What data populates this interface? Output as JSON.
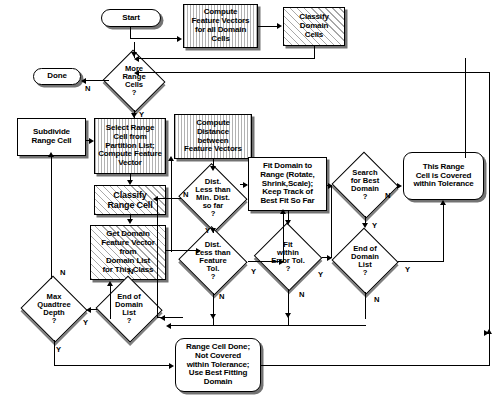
{
  "diagram": {
    "type": "flowchart",
    "nodes": [
      {
        "id": "start",
        "label": "Start",
        "shape": "terminator",
        "fill": "plain",
        "x": 101,
        "y": 9,
        "w": 60,
        "h": 18
      },
      {
        "id": "computeFV",
        "label": "Compute\nFeature Vectors\nfor all Domain\nCells",
        "shape": "process",
        "fill": "stripe",
        "x": 183,
        "y": 4,
        "w": 75,
        "h": 44
      },
      {
        "id": "classifyDom",
        "label": "Classify\nDomain\nCells",
        "shape": "process",
        "fill": "hatch",
        "x": 283,
        "y": 7,
        "w": 62,
        "h": 39
      },
      {
        "id": "moreRange",
        "label": "More\nRange\nCells\n?",
        "shape": "decision",
        "fill": "plain",
        "x": 103,
        "y": 52,
        "w": 62,
        "h": 58
      },
      {
        "id": "done",
        "label": "Done",
        "shape": "terminator",
        "fill": "plain",
        "x": 33,
        "y": 68,
        "w": 48,
        "h": 17
      },
      {
        "id": "subdivide",
        "label": "Subdivide\nRange Cell",
        "shape": "process",
        "fill": "plain",
        "x": 17,
        "y": 118,
        "w": 69,
        "h": 38
      },
      {
        "id": "selectRange",
        "label": "Select Range\nCell from\nPartition List;\nCompute Feature\nVector",
        "shape": "process",
        "fill": "stripe",
        "x": 94,
        "y": 118,
        "w": 72,
        "h": 56
      },
      {
        "id": "computeDist",
        "label": "Compute\nDistance\nbetween\nFeature Vectors",
        "shape": "process",
        "fill": "stripe",
        "x": 174,
        "y": 114,
        "w": 78,
        "h": 45
      },
      {
        "id": "classifyRange",
        "label": "Classify\nRange Cell",
        "shape": "process",
        "fill": "hatch",
        "x": 94,
        "y": 185,
        "w": 72,
        "h": 30
      },
      {
        "id": "getDomainFV",
        "label": "Get Domain\nFeature Vector\nfrom\nDomain List\nfor This Class",
        "shape": "process",
        "fill": "hatch",
        "x": 90,
        "y": 225,
        "w": 76,
        "h": 55
      },
      {
        "id": "fitDomain",
        "label": "Fit Domain to\nRange (Rotate,\nShrink,Scale);\nKeep Track of\nBest Fit So Far",
        "shape": "process",
        "fill": "plain",
        "x": 248,
        "y": 157,
        "w": 79,
        "h": 54
      },
      {
        "id": "distMin",
        "label": "Dist.\nLess than\nMin. Dist.\nso far\n?",
        "shape": "decision",
        "fill": "hatch",
        "x": 178,
        "y": 166,
        "w": 70,
        "h": 64
      },
      {
        "id": "distFeat",
        "label": "Dist.\nLess than\nFeature\nTol.\n?",
        "shape": "decision",
        "fill": "hatch",
        "x": 178,
        "y": 229,
        "w": 70,
        "h": 64
      },
      {
        "id": "fitError",
        "label": "Fit\nwithin\nError Tol.\n?",
        "shape": "decision",
        "fill": "plain",
        "x": 254,
        "y": 225,
        "w": 68,
        "h": 64
      },
      {
        "id": "searchBest",
        "label": "Search\nfor Best\nDomain\n?",
        "shape": "decision",
        "fill": "plain",
        "x": 332,
        "y": 154,
        "w": 66,
        "h": 62
      },
      {
        "id": "endDomList2",
        "label": "End of\nDomain\nList\n?",
        "shape": "decision",
        "fill": "plain",
        "x": 332,
        "y": 230,
        "w": 66,
        "h": 62
      },
      {
        "id": "covered",
        "label": "This Range\nCell is Covered\nwithin Tolerance",
        "shape": "terminator",
        "fill": "plain",
        "x": 403,
        "y": 152,
        "w": 81,
        "h": 48
      },
      {
        "id": "maxDepth",
        "label": "Max\nQuadtree\nDepth\n?",
        "shape": "decision",
        "fill": "plain",
        "x": 21,
        "y": 278,
        "w": 66,
        "h": 62
      },
      {
        "id": "endDomList1",
        "label": "End of\nDomain\nList\n?",
        "shape": "decision",
        "fill": "plain",
        "x": 96,
        "y": 278,
        "w": 66,
        "h": 62
      },
      {
        "id": "rangeDone",
        "label": "Range Cell Done;\nNot Covered\nwithin Tolerance;\nUse Best Fitting\nDomain",
        "shape": "terminator",
        "fill": "plain",
        "x": 175,
        "y": 338,
        "w": 86,
        "h": 54
      }
    ],
    "edge_labels": [
      {
        "text": "N",
        "x": 85,
        "y": 84
      },
      {
        "text": "Y",
        "x": 139,
        "y": 110
      },
      {
        "text": "N",
        "x": 183,
        "y": 190
      },
      {
        "text": "Y",
        "x": 205,
        "y": 226
      },
      {
        "text": "Y",
        "x": 251,
        "y": 267
      },
      {
        "text": "N",
        "x": 219,
        "y": 292
      },
      {
        "text": "N",
        "x": 299,
        "y": 290
      },
      {
        "text": "Y",
        "x": 318,
        "y": 270
      },
      {
        "text": "N",
        "x": 385,
        "y": 191
      },
      {
        "text": "Y",
        "x": 372,
        "y": 221
      },
      {
        "text": "Y",
        "x": 405,
        "y": 265
      },
      {
        "text": "N",
        "x": 374,
        "y": 295
      },
      {
        "text": "N",
        "x": 60,
        "y": 268
      },
      {
        "text": "N",
        "x": 128,
        "y": 267
      },
      {
        "text": "Y",
        "x": 83,
        "y": 318
      },
      {
        "text": "Y",
        "x": 56,
        "y": 345
      }
    ]
  }
}
